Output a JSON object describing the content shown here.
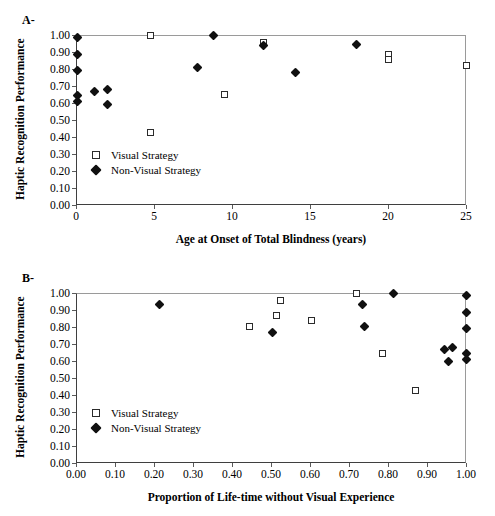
{
  "figure": {
    "panels": [
      {
        "letter": "A-",
        "ylabel": "Haptic Recognition Performance",
        "xlabel": "Age at Onset of Total Blindness (years)",
        "legend": [
          {
            "label": "Visual Strategy",
            "marker": "open-square"
          },
          {
            "label": "Non-Visual Strategy",
            "marker": "filled-diamond"
          }
        ]
      },
      {
        "letter": "B-",
        "ylabel": "Haptic Recognition Performance",
        "xlabel": "Proportion of Life-time without Visual Experience",
        "legend": [
          {
            "label": "Visual Strategy",
            "marker": "open-square"
          },
          {
            "label": "Non-Visual Strategy",
            "marker": "filled-diamond"
          }
        ]
      }
    ]
  },
  "chart_data": [
    {
      "type": "scatter",
      "panel": "A-",
      "title": "",
      "xlabel": "Age at Onset of Total Blindness (years)",
      "ylabel": "Haptic Recognition Performance",
      "xlim": [
        0,
        25
      ],
      "ylim": [
        0.0,
        1.0
      ],
      "xticks": [
        0,
        5,
        10,
        15,
        20,
        25
      ],
      "xticklabels": [
        "0",
        "5",
        "10",
        "15",
        "20",
        "25"
      ],
      "yticks": [
        0.0,
        0.1,
        0.2,
        0.3,
        0.4,
        0.5,
        0.6,
        0.7,
        0.8,
        0.9,
        1.0
      ],
      "yticklabels": [
        "0.00",
        "0.10",
        "0.20",
        "0.30",
        "0.40",
        "0.50",
        "0.60",
        "0.70",
        "0.80",
        "0.90",
        "1.00"
      ],
      "grid": false,
      "legend_position": "lower-left-inside",
      "series": [
        {
          "name": "Visual Strategy",
          "marker": "open-square",
          "points": [
            {
              "x": 4.75,
              "y": 1.0
            },
            {
              "x": 4.75,
              "y": 0.425
            },
            {
              "x": 9.5,
              "y": 0.65
            },
            {
              "x": 12.0,
              "y": 0.955
            },
            {
              "x": 20.0,
              "y": 0.885
            },
            {
              "x": 20.0,
              "y": 0.855
            },
            {
              "x": 25.0,
              "y": 0.82
            }
          ]
        },
        {
          "name": "Non-Visual Strategy",
          "marker": "filled-diamond",
          "points": [
            {
              "x": 0.1,
              "y": 0.985
            },
            {
              "x": 0.1,
              "y": 0.885
            },
            {
              "x": 0.1,
              "y": 0.79
            },
            {
              "x": 0.1,
              "y": 0.645
            },
            {
              "x": 0.1,
              "y": 0.61
            },
            {
              "x": 1.2,
              "y": 0.67
            },
            {
              "x": 2.0,
              "y": 0.68
            },
            {
              "x": 2.0,
              "y": 0.59
            },
            {
              "x": 7.8,
              "y": 0.81
            },
            {
              "x": 8.8,
              "y": 1.0
            },
            {
              "x": 12.0,
              "y": 0.94
            },
            {
              "x": 14.1,
              "y": 0.78
            },
            {
              "x": 18.0,
              "y": 0.945
            }
          ]
        }
      ]
    },
    {
      "type": "scatter",
      "panel": "B-",
      "title": "",
      "xlabel": "Proportion of Life-time without Visual Experience",
      "ylabel": "Haptic Recognition Performance",
      "xlim": [
        0.0,
        1.0
      ],
      "ylim": [
        0.0,
        1.0
      ],
      "xticks": [
        0.0,
        0.1,
        0.2,
        0.3,
        0.4,
        0.5,
        0.6,
        0.7,
        0.8,
        0.9,
        1.0
      ],
      "xticklabels": [
        "0.00",
        "0.10",
        "0.20",
        "0.30",
        "0.40",
        "0.50",
        "0.60",
        "0.70",
        "0.80",
        "0.90",
        "1.00"
      ],
      "yticks": [
        0.0,
        0.1,
        0.2,
        0.3,
        0.4,
        0.5,
        0.6,
        0.7,
        0.8,
        0.9,
        1.0
      ],
      "yticklabels": [
        "0.00",
        "0.10",
        "0.20",
        "0.30",
        "0.40",
        "0.50",
        "0.60",
        "0.70",
        "0.80",
        "0.90",
        "1.00"
      ],
      "grid": false,
      "legend_position": "lower-left-inside",
      "series": [
        {
          "name": "Visual Strategy",
          "marker": "open-square",
          "points": [
            {
              "x": 0.445,
              "y": 0.805
            },
            {
              "x": 0.515,
              "y": 0.87
            },
            {
              "x": 0.525,
              "y": 0.955
            },
            {
              "x": 0.605,
              "y": 0.84
            },
            {
              "x": 0.72,
              "y": 1.0
            },
            {
              "x": 0.785,
              "y": 0.645
            },
            {
              "x": 0.87,
              "y": 0.425
            }
          ]
        },
        {
          "name": "Non-Visual Strategy",
          "marker": "filled-diamond",
          "points": [
            {
              "x": 0.215,
              "y": 0.93
            },
            {
              "x": 0.505,
              "y": 0.77
            },
            {
              "x": 0.735,
              "y": 0.93
            },
            {
              "x": 0.74,
              "y": 0.805
            },
            {
              "x": 0.815,
              "y": 1.0
            },
            {
              "x": 0.945,
              "y": 0.67
            },
            {
              "x": 0.955,
              "y": 0.595
            },
            {
              "x": 0.965,
              "y": 0.68
            },
            {
              "x": 1.0,
              "y": 0.985
            },
            {
              "x": 1.0,
              "y": 0.885
            },
            {
              "x": 1.0,
              "y": 0.79
            },
            {
              "x": 1.0,
              "y": 0.645
            },
            {
              "x": 1.0,
              "y": 0.61
            }
          ]
        }
      ]
    }
  ]
}
